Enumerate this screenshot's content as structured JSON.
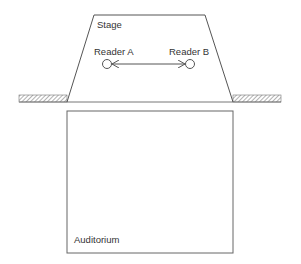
{
  "diagram": {
    "stage_label": "Stage",
    "auditorium_label": "Auditorium",
    "reader_a_label": "Reader A",
    "reader_b_label": "Reader B",
    "arrow": "bidirectional",
    "colors": {
      "line": "#555555",
      "text": "#333333",
      "hatch": "#666666",
      "background": "#ffffff"
    }
  }
}
